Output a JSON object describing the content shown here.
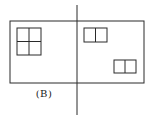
{
  "diagram": {
    "caption": "(B)",
    "stroke_color": "#2a2a2a",
    "outer_rect": {
      "x": 10,
      "y": 21,
      "w": 134,
      "h": 62
    },
    "axis_line": {
      "x": 77,
      "y1": 5,
      "y2": 115
    },
    "windows": [
      {
        "name": "four-pane-window",
        "x": 17,
        "y": 28,
        "w": 24,
        "h": 27,
        "cols": 2,
        "rows": 2
      },
      {
        "name": "two-pane-window-top",
        "x": 84,
        "y": 28,
        "w": 23,
        "h": 14,
        "cols": 2,
        "rows": 1
      },
      {
        "name": "two-pane-window-bottom",
        "x": 114,
        "y": 60,
        "w": 22,
        "h": 13,
        "cols": 2,
        "rows": 1
      }
    ]
  }
}
